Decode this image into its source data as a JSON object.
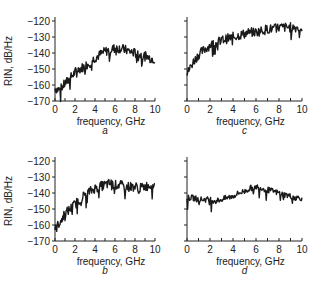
{
  "chart_data": [
    {
      "panel": "a",
      "type": "line",
      "xlabel": "frequency, GHz",
      "ylabel": "RIN, dB/Hz",
      "xlim": [
        0,
        10
      ],
      "ylim": [
        -170,
        -120
      ],
      "xticks": [
        0,
        2,
        4,
        6,
        8,
        10
      ],
      "yticks": [
        -120,
        -130,
        -140,
        -150,
        -160,
        -170
      ],
      "x": [
        0,
        0.5,
        1,
        1.5,
        2,
        2.5,
        3,
        3.5,
        4,
        4.5,
        5,
        5.5,
        6,
        6.5,
        7,
        7.5,
        8,
        8.5,
        9,
        9.5,
        10
      ],
      "values": [
        -162,
        -163,
        -159,
        -156,
        -152,
        -150,
        -148,
        -146,
        -143,
        -141,
        -139,
        -138,
        -137,
        -137,
        -138,
        -139,
        -140,
        -141,
        -142,
        -143,
        -144
      ]
    },
    {
      "panel": "c",
      "type": "line",
      "xlabel": "frequency, GHz",
      "ylabel": "",
      "xlim": [
        0,
        10
      ],
      "ylim": [
        -170,
        -120
      ],
      "xticks": [
        0,
        2,
        4,
        6,
        8,
        10
      ],
      "yticks": [
        -120,
        -130,
        -140,
        -150,
        -160,
        -170
      ],
      "x": [
        0,
        0.5,
        1,
        1.5,
        2,
        2.5,
        3,
        3.5,
        4,
        4.5,
        5,
        5.5,
        6,
        6.5,
        7,
        7.5,
        8,
        8.5,
        9,
        9.5,
        10
      ],
      "values": [
        -153,
        -146,
        -141,
        -138,
        -135,
        -134,
        -132,
        -131,
        -130,
        -129,
        -128,
        -127,
        -127,
        -126,
        -125,
        -125,
        -124,
        -124,
        -124,
        -124,
        -125
      ]
    },
    {
      "panel": "b",
      "type": "line",
      "xlabel": "frequency, GHz",
      "ylabel": "RIN, dB/Hz",
      "xlim": [
        0,
        10
      ],
      "ylim": [
        -170,
        -120
      ],
      "xticks": [
        0,
        2,
        4,
        6,
        8,
        10
      ],
      "yticks": [
        -120,
        -130,
        -140,
        -150,
        -160,
        -170
      ],
      "x": [
        0,
        0.5,
        1,
        1.5,
        2,
        2.5,
        3,
        3.5,
        4,
        4.5,
        5,
        5.5,
        6,
        6.5,
        7,
        7.5,
        8,
        8.5,
        9,
        9.5,
        10
      ],
      "values": [
        -163,
        -158,
        -153,
        -150,
        -147,
        -144,
        -141,
        -139,
        -137,
        -136,
        -135,
        -134,
        -135,
        -135,
        -136,
        -136,
        -136,
        -137,
        -136,
        -135,
        -135
      ]
    },
    {
      "panel": "d",
      "type": "line",
      "xlabel": "frequency, GHz",
      "ylabel": "",
      "xlim": [
        0,
        10
      ],
      "ylim": [
        -170,
        -120
      ],
      "xticks": [
        0,
        2,
        4,
        6,
        8,
        10
      ],
      "yticks": [
        -120,
        -130,
        -140,
        -150,
        -160,
        -170
      ],
      "x": [
        0,
        0.5,
        1,
        1.5,
        2,
        2.5,
        3,
        3.5,
        4,
        4.5,
        5,
        5.5,
        6,
        6.5,
        7,
        7.5,
        8,
        8.5,
        9,
        9.5,
        10
      ],
      "values": [
        -143,
        -143,
        -144,
        -144,
        -144,
        -145,
        -144,
        -143,
        -142,
        -140,
        -139,
        -137,
        -136,
        -137,
        -138,
        -139,
        -140,
        -141,
        -142,
        -143,
        -143
      ]
    }
  ],
  "labels": {
    "a": "a",
    "b": "b",
    "c": "c",
    "d": "d",
    "xlabel": "frequency, GHz",
    "ylabel": "RIN, dB/Hz"
  }
}
